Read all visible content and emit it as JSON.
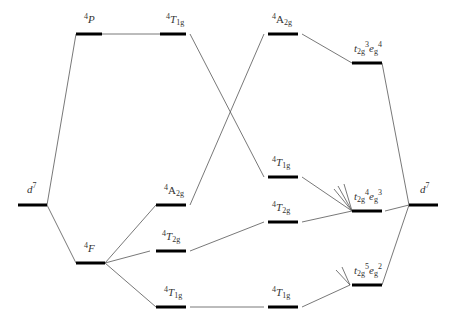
{
  "diagram": {
    "title": "",
    "type": "correlation-diagram",
    "colors": {
      "line": "#555555",
      "level": "#000000",
      "text": "#333333"
    },
    "levels": [
      {
        "id": "d7-left",
        "label": "d7",
        "x1": 18,
        "x2": 47,
        "y": 205
      },
      {
        "id": "4P",
        "label": "4P",
        "x1": 76,
        "x2": 102,
        "y": 34
      },
      {
        "id": "4F",
        "label": "4F",
        "x1": 76,
        "x2": 105,
        "y": 263
      },
      {
        "id": "4T1g-a",
        "label": "4T1g",
        "x1": 160,
        "x2": 186,
        "y": 34
      },
      {
        "id": "4A2g-a",
        "label": "4A2g",
        "x1": 156,
        "x2": 186,
        "y": 205
      },
      {
        "id": "4T2g-a",
        "label": "4T2g",
        "x1": 156,
        "x2": 186,
        "y": 251
      },
      {
        "id": "4T1g-b",
        "label": "4T1g",
        "x1": 156,
        "x2": 186,
        "y": 307
      },
      {
        "id": "4A2g-b",
        "label": "4A2g",
        "x1": 268,
        "x2": 298,
        "y": 34
      },
      {
        "id": "4T1g-c",
        "label": "4T1g",
        "x1": 268,
        "x2": 298,
        "y": 177
      },
      {
        "id": "4T2g-b",
        "label": "4T2g",
        "x1": 268,
        "x2": 298,
        "y": 222
      },
      {
        "id": "4T1g-d",
        "label": "4T1g",
        "x1": 268,
        "x2": 298,
        "y": 307
      },
      {
        "id": "t2g3eg4",
        "label": "t2g3eg4",
        "x1": 352,
        "x2": 382,
        "y": 63
      },
      {
        "id": "t2g4eg3",
        "label": "t2g4eg3",
        "x1": 352,
        "x2": 382,
        "y": 211
      },
      {
        "id": "t2g5eg2",
        "label": "t2g5eg2",
        "x1": 352,
        "x2": 382,
        "y": 285
      },
      {
        "id": "d7-right",
        "label": "d7",
        "x1": 409,
        "x2": 438,
        "y": 205
      }
    ],
    "columns": [
      "Free ion",
      "Terms",
      "Weak field",
      "Strong field",
      "Configurations",
      "Strong-field limit"
    ]
  }
}
